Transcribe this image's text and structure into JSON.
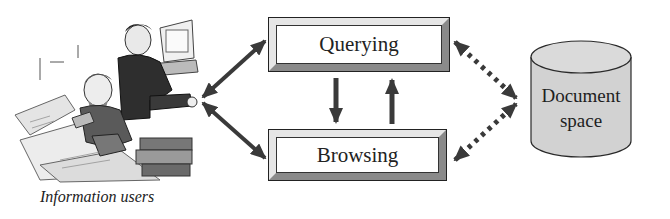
{
  "users": {
    "caption": "Information users",
    "icon": "people-at-computers-illustration"
  },
  "modes": {
    "querying": "Querying",
    "browsing": "Browsing"
  },
  "document_space": {
    "line1": "Document",
    "line2": "space"
  },
  "colors": {
    "arrow": "#3a3a3a",
    "cylinder_fill": "#d2d2d2",
    "box_border": "#222222"
  },
  "connections": [
    {
      "from": "Information users",
      "to": "Querying",
      "style": "solid",
      "direction": "both"
    },
    {
      "from": "Information users",
      "to": "Browsing",
      "style": "solid",
      "direction": "both"
    },
    {
      "from": "Querying",
      "to": "Browsing",
      "style": "solid",
      "direction": "one-way"
    },
    {
      "from": "Browsing",
      "to": "Querying",
      "style": "solid",
      "direction": "one-way"
    },
    {
      "from": "Querying",
      "to": "Document space",
      "style": "dotted",
      "direction": "both"
    },
    {
      "from": "Browsing",
      "to": "Document space",
      "style": "dotted",
      "direction": "both"
    }
  ]
}
